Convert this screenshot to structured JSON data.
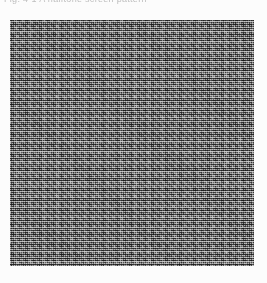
{
  "page": {
    "width_px": 267,
    "height_px": 283,
    "background_color": "#fcfcfc",
    "kind": "scanned-document-page"
  },
  "caption": {
    "text": "Fig. 4-1  A halftone screen pattern",
    "note": "clipped at top edge of scan; only baseline fragments visible",
    "color": "#b4b4b4",
    "legible": false
  },
  "figure": {
    "name": "halftone-noise-block",
    "x_px": 10,
    "y_px": 20,
    "width_px": 244,
    "height_px": 246,
    "base_color": "#8a8a8a",
    "dark_tone": "#4a4a4a",
    "light_tone": "#d6d6d6",
    "pattern": "random 1-2px dither / halftone screen",
    "border": "none"
  }
}
